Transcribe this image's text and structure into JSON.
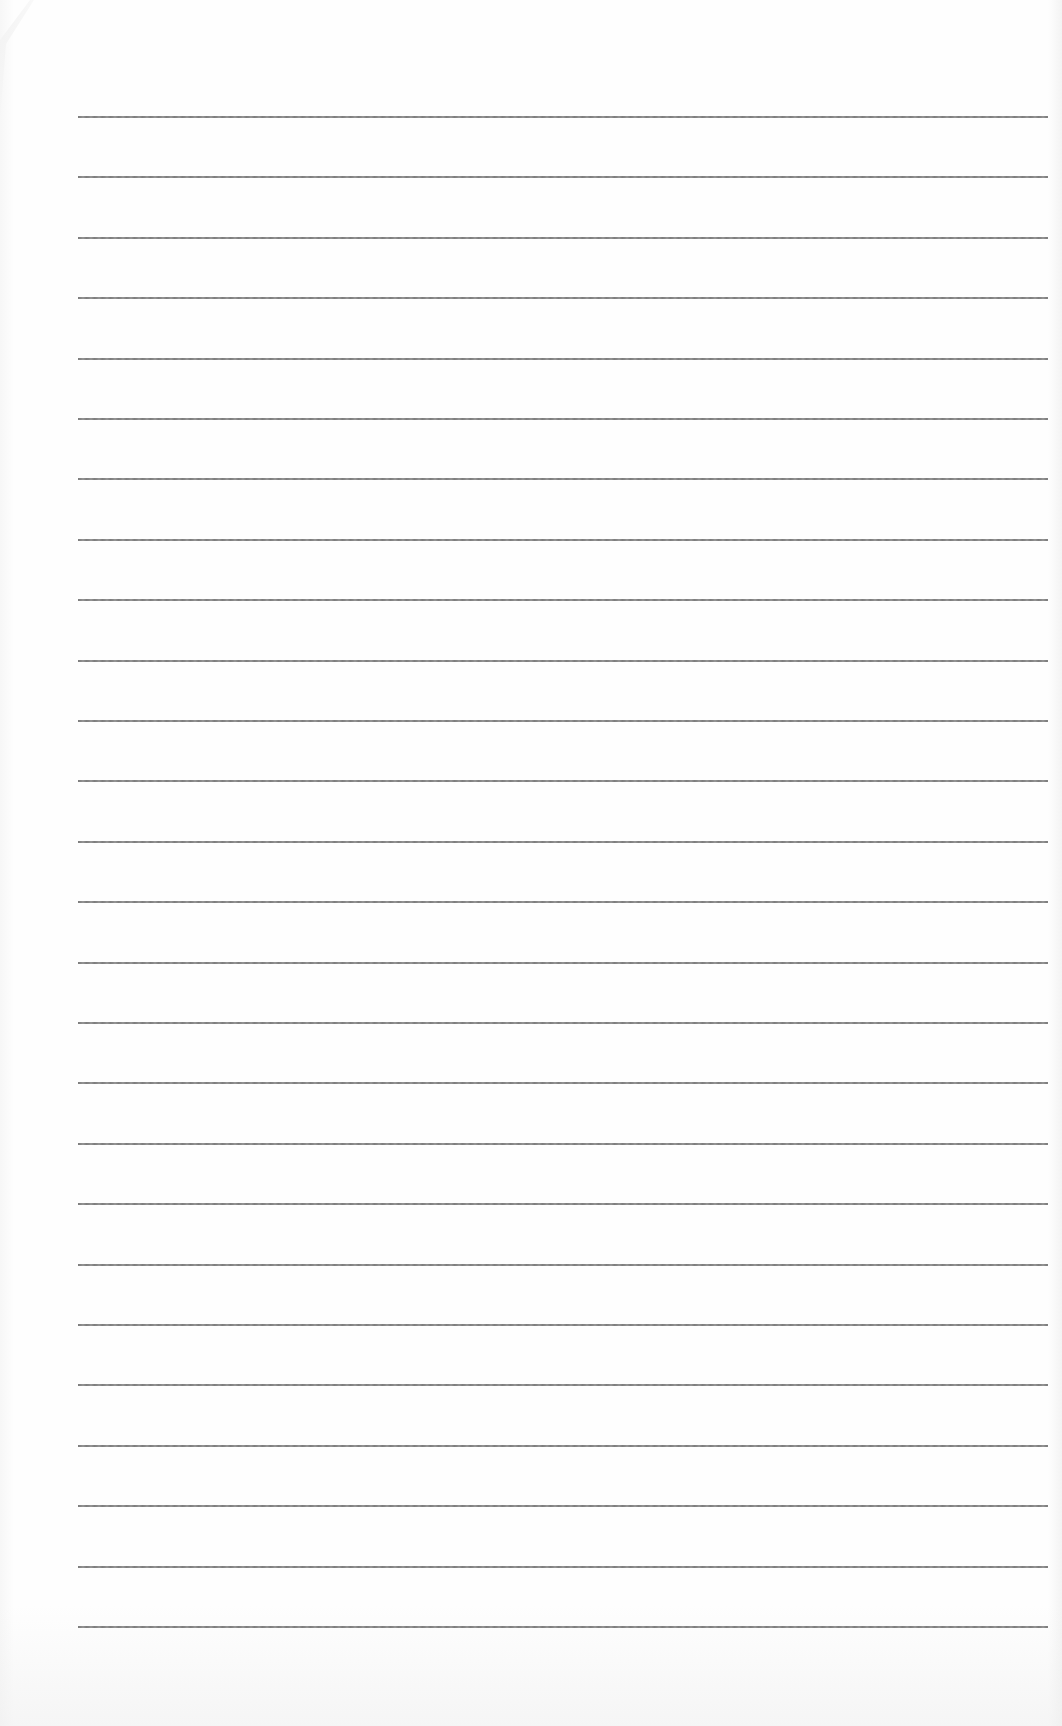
{
  "document": {
    "type": "lined-paper",
    "text": "",
    "rules": {
      "count": 26,
      "first_y": 116,
      "spacing": 60.4,
      "left_x": 78,
      "right_x": 1048,
      "color": "#757575"
    },
    "paper_color": "#fefefe"
  }
}
